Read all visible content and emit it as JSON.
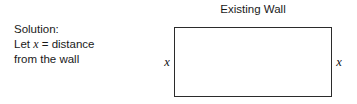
{
  "figure": {
    "type": "geometry-diagram",
    "background_color": "#ffffff",
    "stroke_color": "#2b2b2b",
    "text_color": "#1a1a1a"
  },
  "solution": {
    "line1": "Solution:",
    "line2_prefix": "Let",
    "line2_variable": "x",
    "line2_equals": "=",
    "line2_suffix": "distance",
    "line3": "from the wall"
  },
  "diagram": {
    "wall_label": "Existing Wall",
    "left_side_label": "x",
    "right_side_label": "x",
    "rect": {
      "width_px": 158,
      "height_px": 70,
      "left_px": 174,
      "top_px": 27
    }
  }
}
